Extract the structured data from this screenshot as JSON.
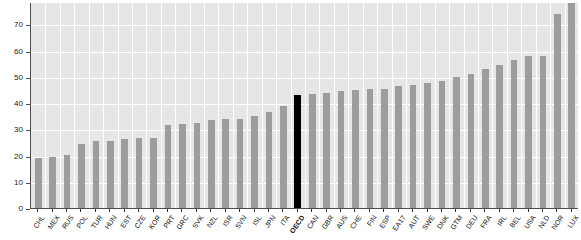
{
  "chart_data": {
    "type": "bar",
    "title": "",
    "subtitle": "",
    "xlabel": "",
    "ylabel": "",
    "ylim": [
      0,
      78.5
    ],
    "yticks": [
      0,
      10,
      20,
      30,
      40,
      50,
      60,
      70
    ],
    "ytick_labels": [
      "0",
      "10",
      "20",
      "30",
      "40",
      "50",
      "60",
      "70"
    ],
    "grid": true,
    "legend": "none",
    "bar_color": "#9d9d9d",
    "highlight_color": "#000000",
    "highlight_category": "OECD",
    "plot_background": "#e6e6e6",
    "gridline_color": "#ffffff",
    "axis_color": "#4d4d4d",
    "note": "Last bar (LUX) is clipped by the top of the plot area",
    "categories": [
      "CHL",
      "MEX",
      "RUS",
      "POL",
      "TUR",
      "HUN",
      "EST",
      "CZE",
      "KOR",
      "PRT",
      "GRC",
      "SVK",
      "NZL",
      "ISR",
      "SVN",
      "ISL",
      "JPN",
      "ITA",
      "OECD",
      "CAN",
      "GBR",
      "AUS",
      "CHE",
      "FIN",
      "ESP",
      "EA17",
      "AUT",
      "SWE",
      "DNK",
      "GTM",
      "DEU",
      "FRA",
      "IRL",
      "BEL",
      "USA",
      "NLD",
      "NOR",
      "LUX"
    ],
    "values": [
      19.0,
      19.5,
      20.3,
      24.3,
      25.5,
      25.6,
      26.3,
      26.5,
      26.7,
      31.5,
      32.0,
      32.5,
      33.5,
      33.8,
      34.0,
      35.0,
      36.5,
      39.0,
      43.0,
      43.5,
      44.0,
      44.5,
      45.0,
      45.3,
      45.5,
      46.5,
      47.0,
      47.5,
      48.5,
      50.0,
      51.0,
      53.0,
      54.5,
      56.5,
      58.0,
      58.0,
      74.0,
      79.0
    ]
  }
}
